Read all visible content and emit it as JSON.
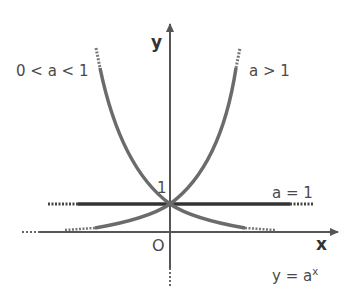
{
  "diagram": {
    "axes": {
      "x_label": "x",
      "y_label": "y",
      "origin_label": "O",
      "y_intercept_label": "1"
    },
    "curves": [
      {
        "label": "0 < a < 1",
        "description": "decreasing exponential curve"
      },
      {
        "label": "a > 1",
        "description": "increasing exponential curve"
      },
      {
        "label": "a = 1",
        "description": "horizontal line y = 1"
      }
    ],
    "formula": {
      "base": "y = a",
      "exponent": "x"
    },
    "colors": {
      "curve": "#6b6b6b",
      "line": "#333333",
      "axis": "#555555",
      "text": "#4a4a4a"
    }
  }
}
